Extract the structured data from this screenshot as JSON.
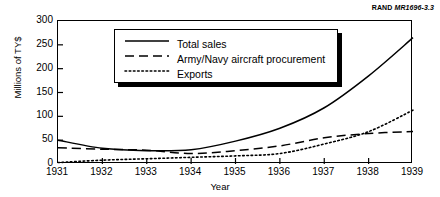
{
  "credit": {
    "org": "RAND",
    "number": "MR1696-3.3"
  },
  "chart_data": {
    "type": "line",
    "title": "",
    "xlabel": "Year",
    "ylabel": "Millions of TY$",
    "categories": [
      "1931",
      "1932",
      "1933",
      "1934",
      "1935",
      "1936",
      "1937",
      "1938",
      "1939"
    ],
    "x": [
      1931,
      1932,
      1933,
      1934,
      1935,
      1936,
      1937,
      1938,
      1939
    ],
    "xlim": [
      1931,
      1939
    ],
    "ylim": [
      0,
      300
    ],
    "yticks": [
      0,
      50,
      100,
      150,
      200,
      250,
      300
    ],
    "xticks": [
      "1931",
      "1932",
      "1933",
      "1934",
      "1935",
      "1936",
      "1937",
      "1938",
      "1939"
    ],
    "grid": false,
    "legend_position": "upper-left-inside",
    "series": [
      {
        "name": "Total sales",
        "style": "solid",
        "values": [
          50,
          33,
          28,
          30,
          48,
          75,
          118,
          185,
          265
        ]
      },
      {
        "name": "Army/Navy aircraft procurement",
        "style": "dashed",
        "values": [
          34,
          31,
          29,
          22,
          28,
          38,
          55,
          64,
          68
        ]
      },
      {
        "name": "Exports",
        "style": "dotted",
        "values": [
          3,
          8,
          11,
          14,
          17,
          22,
          42,
          68,
          113
        ]
      }
    ]
  }
}
